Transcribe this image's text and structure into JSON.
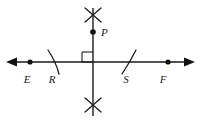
{
  "figure": {
    "background_color": "#ffffff",
    "stroke_color": "#1a1a1a",
    "width": 201,
    "height": 121
  },
  "labels": [
    {
      "id": "E",
      "text": "E",
      "x": 27,
      "y": 83
    },
    {
      "id": "R",
      "text": "R",
      "x": 52,
      "y": 83
    },
    {
      "id": "S",
      "text": "S",
      "x": 126,
      "y": 83
    },
    {
      "id": "F",
      "text": "F",
      "x": 163,
      "y": 83
    },
    {
      "id": "P",
      "text": "P",
      "x": 101,
      "y": 36
    }
  ],
  "points": [
    {
      "id": "E",
      "x": 30,
      "y": 62,
      "r": 2.6
    },
    {
      "id": "F",
      "x": 168,
      "y": 62,
      "r": 2.6
    },
    {
      "id": "P",
      "x": 93,
      "y": 32,
      "r": 2.8
    }
  ],
  "lines": [
    {
      "id": "horizontal-line",
      "x1": 10,
      "y1": 62,
      "x2": 191,
      "y2": 62,
      "width": 1.4
    },
    {
      "id": "vertical-line",
      "x1": 93,
      "y1": 8,
      "x2": 93,
      "y2": 116,
      "width": 1.4
    }
  ],
  "arrowheads": [
    {
      "id": "left-arrow",
      "direction": "left",
      "x": 8,
      "y": 62
    },
    {
      "id": "right-arrow",
      "direction": "right",
      "x": 193,
      "y": 62
    }
  ],
  "arc_marks": [
    {
      "id": "arc-R",
      "x1": 48,
      "y1": 51,
      "x2": 60,
      "y2": 73,
      "note": "compass arc crossing line at R"
    },
    {
      "id": "arc-S",
      "x1": 123,
      "y1": 73,
      "x2": 135,
      "y2": 51,
      "note": "compass arc crossing line at S"
    }
  ],
  "cross_marks": [
    {
      "id": "top-cross",
      "cx": 93,
      "cy": 15,
      "size": 9
    },
    {
      "id": "bottom-cross",
      "cx": 93,
      "cy": 105,
      "size": 9
    }
  ],
  "right_angle": {
    "id": "right-angle-marker",
    "x": 82,
    "y": 52,
    "size": 11,
    "corner": "upper-left"
  }
}
